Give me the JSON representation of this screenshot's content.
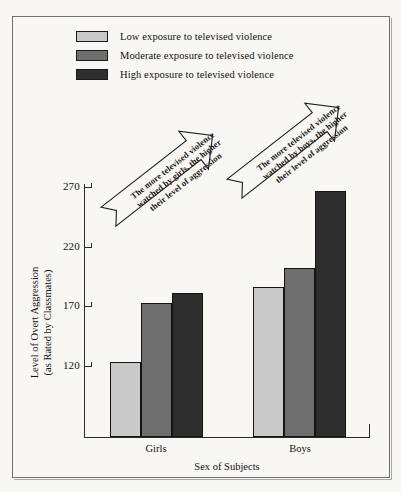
{
  "chart_data": {
    "type": "bar",
    "title": "",
    "xlabel": "Sex of Subjects",
    "ylabel": "Level of Overt Aggression (as Rated by Classmates)",
    "ylabel_line1": "Level of Overt Aggression",
    "ylabel_line2": "(as Rated by Classmates)",
    "categories": [
      "Girls",
      "Boys"
    ],
    "series": [
      {
        "name": "Low exposure to televised violence",
        "values": [
          123,
          186
        ],
        "color": "#c9c9c9"
      },
      {
        "name": "Moderate exposure to televised violence",
        "values": [
          173,
          202
        ],
        "color": "#6e6e6e"
      },
      {
        "name": "High exposure to televised violence",
        "values": [
          181,
          267
        ],
        "color": "#2e2e2e"
      }
    ],
    "yticks": [
      120,
      170,
      220,
      270
    ],
    "ylim": [
      106,
      283
    ],
    "grid": false,
    "legend_position": "top-left",
    "annotations": [
      "The more televised violence watched by girls, the higher their level of aggression",
      "The more televised violence watched by boys, the higher their level of aggression"
    ]
  },
  "legend": {
    "items": [
      {
        "label": "Low exposure to televised violence",
        "color": "#c9c9c9"
      },
      {
        "label": "Moderate exposure to televised violence",
        "color": "#6e6e6e"
      },
      {
        "label": "High exposure to televised violence",
        "color": "#2e2e2e"
      }
    ]
  },
  "axes": {
    "y_tick_labels": [
      "270",
      "220",
      "170",
      "120"
    ],
    "y_title_line1": "Level of Overt Aggression",
    "y_title_line2": "(as Rated by Classmates)",
    "x_title": "Sex of Subjects",
    "x_group_labels": [
      "Girls",
      "Boys"
    ]
  },
  "annotations": {
    "girls": {
      "line1": "The more televised violence",
      "line2": "watched by girls, the higher",
      "line3": "their level of aggression"
    },
    "boys": {
      "line1": "The more televised violence",
      "line2": "watched by boys, the higher",
      "line3": "their level of aggression"
    }
  },
  "colors": {
    "background": "#f8f7f3",
    "frame": "#6f6f6f",
    "axis": "#2b2b2b",
    "low": "#c9c9c9",
    "moderate": "#6e6e6e",
    "high": "#2e2e2e"
  }
}
